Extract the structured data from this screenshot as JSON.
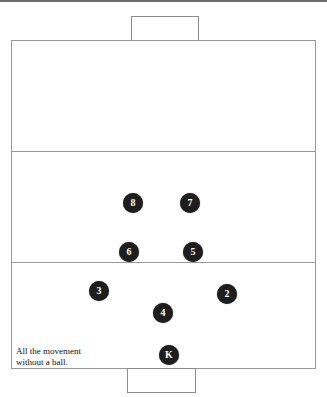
{
  "diagram": {
    "type": "football-pitch-formation",
    "caption_lines": [
      "All the movement",
      "without a ball."
    ],
    "colors": {
      "player_fill": "#1e1e1e",
      "player_text": "#ffffff",
      "line": "#9a9a9a"
    },
    "players": [
      {
        "label": "8",
        "x": 133,
        "y": 203
      },
      {
        "label": "7",
        "x": 190,
        "y": 203
      },
      {
        "label": "6",
        "x": 129,
        "y": 252
      },
      {
        "label": "5",
        "x": 193,
        "y": 252
      },
      {
        "label": "3",
        "x": 99,
        "y": 291
      },
      {
        "label": "2",
        "x": 227,
        "y": 294
      },
      {
        "label": "4",
        "x": 163,
        "y": 313
      },
      {
        "label": "K",
        "x": 169,
        "y": 355
      }
    ]
  }
}
